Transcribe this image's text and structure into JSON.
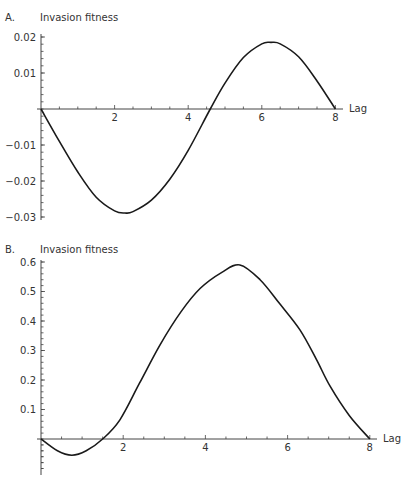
{
  "chart_data": [
    {
      "type": "line",
      "panel": "A.",
      "title": "",
      "ylabel": "Invasion fitness",
      "xlabel": "Lag",
      "xlim": [
        0,
        8
      ],
      "ylim": [
        -0.03,
        0.02
      ],
      "x_ticks": [
        2,
        4,
        6,
        8
      ],
      "x_tick_labels": [
        "2",
        "4",
        "6",
        "8"
      ],
      "y_ticks": [
        0.02,
        0.01,
        -0.01,
        -0.02,
        -0.03
      ],
      "y_tick_labels": [
        "0.02",
        "0.01",
        "-0.01",
        "-0.02",
        "-0.03"
      ],
      "grid": false,
      "series": [
        {
          "name": "Invasion fitness",
          "x": [
            0,
            0.5,
            1,
            1.5,
            2,
            2.28,
            2.5,
            3,
            3.5,
            4,
            4.6,
            5,
            5.5,
            6,
            6.25,
            6.5,
            7,
            7.5,
            8
          ],
          "y": [
            0,
            -0.009,
            -0.0175,
            -0.0245,
            -0.0283,
            -0.0289,
            -0.0285,
            -0.0253,
            -0.0195,
            -0.0115,
            0,
            0.0072,
            0.0143,
            0.0181,
            0.0185,
            0.0181,
            0.0145,
            0.0078,
            0
          ]
        }
      ]
    },
    {
      "type": "line",
      "panel": "B.",
      "title": "",
      "ylabel": "Invasion fitness",
      "xlabel": "Lag",
      "xlim": [
        0,
        8
      ],
      "ylim": [
        -0.1,
        0.6
      ],
      "x_ticks": [
        2,
        4,
        6,
        8
      ],
      "x_tick_labels": [
        "2",
        "4",
        "6",
        "8"
      ],
      "y_ticks": [
        0.6,
        0.5,
        0.4,
        0.3,
        0.2,
        0.1
      ],
      "y_tick_labels": [
        "0.6",
        "0.5",
        "0.4",
        "0.3",
        "0.2",
        "0.1"
      ],
      "grid": false,
      "series": [
        {
          "name": "Invasion fitness",
          "x": [
            0,
            0.4,
            0.75,
            1.1,
            1.5,
            1.92,
            2.4,
            2.9,
            3.4,
            3.87,
            4.4,
            4.84,
            5.33,
            5.8,
            6.3,
            6.7,
            7.03,
            7.5,
            8
          ],
          "y": [
            0,
            -0.04,
            -0.055,
            -0.04,
            0,
            0.065,
            0.19,
            0.32,
            0.43,
            0.51,
            0.565,
            0.59,
            0.54,
            0.46,
            0.37,
            0.27,
            0.18,
            0.08,
            0
          ]
        }
      ]
    }
  ],
  "labels": {
    "panel_a": "A.",
    "panel_b": "B.",
    "ylabel_a": "Invasion fitness",
    "ylabel_b": "Invasion fitness",
    "xlabel_a": "Lag",
    "xlabel_b": "Lag"
  }
}
